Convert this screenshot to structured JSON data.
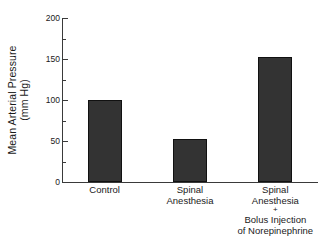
{
  "chart_data": {
    "type": "bar",
    "title": "",
    "xlabel": "",
    "ylabel": "Mean Arterial Pressure (mm Hg)",
    "ylabel_line1": "Mean Arterial Pressure",
    "ylabel_line2": "(mm Hg)",
    "ylim": [
      0,
      200
    ],
    "grid": false,
    "legend": "none",
    "bar_color": "#333333",
    "categories": [
      "Control",
      "Spinal Anesthesia",
      "Spinal Anesthesia + Bolus Injection of Norepinephrine"
    ],
    "values": [
      100,
      52,
      152
    ],
    "y_major_ticks": [
      0,
      50,
      100,
      150,
      200
    ],
    "y_minor_ticks": [
      25,
      75,
      125,
      175
    ],
    "y_tick_labels": [
      "0",
      "50",
      "100",
      "150",
      "200"
    ],
    "category_label_lines": [
      [
        "Control"
      ],
      [
        "Spinal",
        "Anesthesia"
      ],
      [
        "Spinal",
        "Anesthesia",
        "+",
        "Bolus Injection",
        "of Norepinephrine"
      ]
    ]
  }
}
